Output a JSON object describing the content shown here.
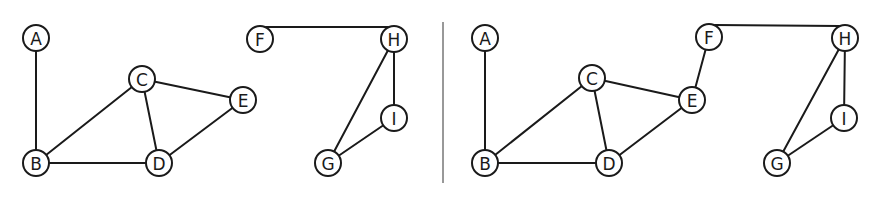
{
  "style": {
    "stroke_color": "#1a1a1a",
    "background": "#ffffff",
    "node_radius": 13
  },
  "divider": {
    "x": 443,
    "y1": 22,
    "y2": 183
  },
  "graphs": [
    {
      "name": "left-graph",
      "nodes": [
        {
          "id": "A",
          "label": "A",
          "x": 36,
          "y": 38
        },
        {
          "id": "B",
          "label": "B",
          "x": 36,
          "y": 163
        },
        {
          "id": "C",
          "label": "C",
          "x": 142,
          "y": 79
        },
        {
          "id": "D",
          "label": "D",
          "x": 159,
          "y": 163
        },
        {
          "id": "E",
          "label": "E",
          "x": 243,
          "y": 100
        },
        {
          "id": "F",
          "label": "F",
          "x": 260,
          "y": 39
        },
        {
          "id": "G",
          "label": "G",
          "x": 328,
          "y": 163
        },
        {
          "id": "H",
          "label": "H",
          "x": 394,
          "y": 39
        },
        {
          "id": "I",
          "label": "I",
          "x": 394,
          "y": 118
        }
      ],
      "edges": [
        [
          "A",
          "B"
        ],
        [
          "B",
          "C"
        ],
        [
          "B",
          "D"
        ],
        [
          "C",
          "D"
        ],
        [
          "C",
          "E"
        ],
        [
          "D",
          "E"
        ],
        [
          "F",
          "H"
        ],
        [
          "H",
          "G"
        ],
        [
          "H",
          "I"
        ],
        [
          "I",
          "G"
        ]
      ]
    },
    {
      "name": "right-graph",
      "nodes": [
        {
          "id": "A",
          "label": "A",
          "x": 485,
          "y": 38
        },
        {
          "id": "B",
          "label": "B",
          "x": 485,
          "y": 163
        },
        {
          "id": "C",
          "label": "C",
          "x": 592,
          "y": 78
        },
        {
          "id": "D",
          "label": "D",
          "x": 609,
          "y": 163
        },
        {
          "id": "E",
          "label": "E",
          "x": 692,
          "y": 100
        },
        {
          "id": "F",
          "label": "F",
          "x": 709,
          "y": 37
        },
        {
          "id": "G",
          "label": "G",
          "x": 777,
          "y": 163
        },
        {
          "id": "H",
          "label": "H",
          "x": 845,
          "y": 38
        },
        {
          "id": "I",
          "label": "I",
          "x": 844,
          "y": 118
        }
      ],
      "edges": [
        [
          "A",
          "B"
        ],
        [
          "B",
          "C"
        ],
        [
          "B",
          "D"
        ],
        [
          "C",
          "D"
        ],
        [
          "C",
          "E"
        ],
        [
          "D",
          "E"
        ],
        [
          "E",
          "F"
        ],
        [
          "F",
          "H"
        ],
        [
          "H",
          "G"
        ],
        [
          "H",
          "I"
        ],
        [
          "I",
          "G"
        ]
      ]
    }
  ]
}
